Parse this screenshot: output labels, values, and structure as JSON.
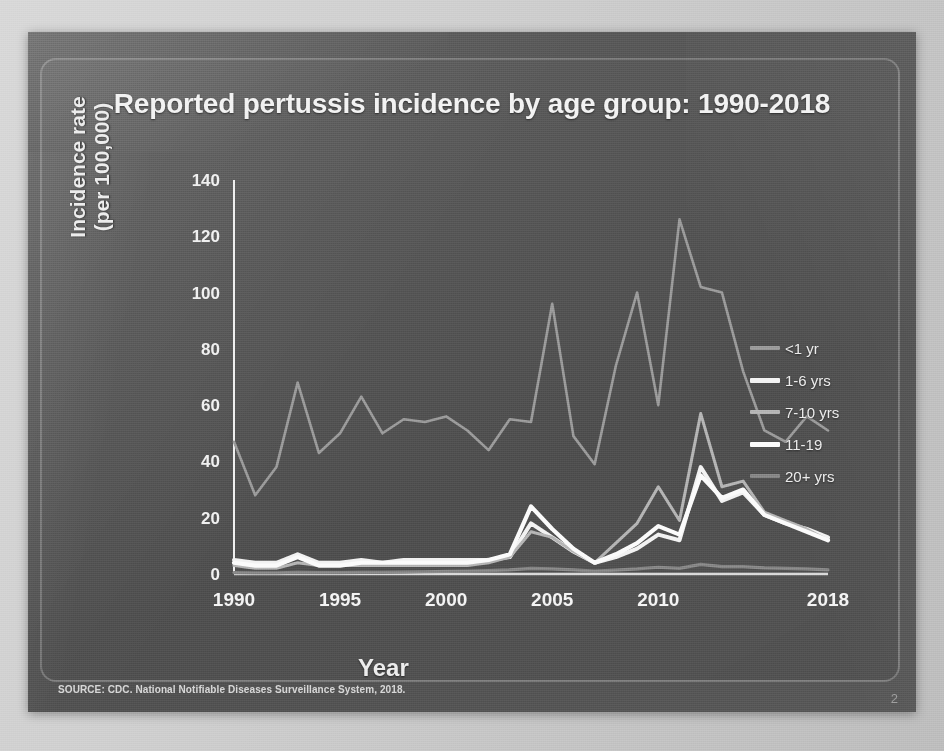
{
  "slide": {
    "title": "Reported pertussis incidence by age group: 1990-2018",
    "source_note": "SOURCE: CDC. National Notifiable Diseases Surveillance System, 2018.",
    "slide_number": "2"
  },
  "legend": {
    "items": [
      {
        "label": "<1 yr",
        "color": "#9a9a9a"
      },
      {
        "label": "1-6 yrs",
        "color": "#f2f2f2"
      },
      {
        "label": "7-10 yrs",
        "color": "#b4b4b4"
      },
      {
        "label": "11-19",
        "color": "#fbfbfb"
      },
      {
        "label": "20+ yrs",
        "color": "#868686"
      }
    ]
  },
  "chart_data": {
    "type": "line",
    "title": "Reported pertussis incidence by age group: 1990-2018",
    "xlabel": "Year",
    "ylabel": "Incidence rate (per 100,000)",
    "xlim": [
      1990,
      2018
    ],
    "ylim": [
      0,
      140
    ],
    "grid": false,
    "legend_position": "right",
    "ytick_labels": [
      "0",
      "20",
      "40",
      "60",
      "80",
      "100",
      "120",
      "140"
    ],
    "yticks": [
      0,
      20,
      40,
      60,
      80,
      100,
      120,
      140
    ],
    "xtick_labels": [
      "1990",
      "1995",
      "2000",
      "2005",
      "2010",
      "2018"
    ],
    "xticks": [
      1990,
      1995,
      2000,
      2005,
      2010,
      2018
    ],
    "x": [
      1990,
      1991,
      1992,
      1993,
      1994,
      1995,
      1996,
      1997,
      1998,
      1999,
      2000,
      2001,
      2002,
      2003,
      2004,
      2005,
      2006,
      2007,
      2008,
      2009,
      2010,
      2011,
      2012,
      2013,
      2014,
      2015,
      2016,
      2017,
      2018
    ],
    "series": [
      {
        "name": "<1 yr",
        "color": "#9a9a9a",
        "values": [
          47,
          28,
          38,
          68,
          43,
          50,
          63,
          50,
          55,
          54,
          56,
          51,
          44,
          55,
          54,
          96,
          49,
          39,
          74,
          100,
          60,
          126,
          102,
          100,
          72,
          51,
          47,
          56,
          51
        ]
      },
      {
        "name": "1-6 yrs",
        "color": "#f2f2f2",
        "values": [
          5,
          4,
          4,
          7,
          4,
          4,
          5,
          4,
          5,
          5,
          5,
          5,
          5,
          6,
          18,
          13,
          8,
          4,
          6,
          9,
          14,
          12,
          38,
          26,
          29,
          21,
          18,
          16,
          13
        ]
      },
      {
        "name": "7-10 yrs",
        "color": "#b4b4b4",
        "values": [
          3,
          2,
          2,
          4,
          3,
          3,
          3,
          3,
          3,
          3,
          3,
          3,
          4,
          6,
          15,
          13,
          8,
          4,
          11,
          18,
          31,
          19,
          57,
          31,
          33,
          22,
          19,
          16,
          12
        ]
      },
      {
        "name": "11-19",
        "color": "#fbfbfb",
        "values": [
          4,
          3,
          3,
          6,
          3,
          3,
          4,
          4,
          4,
          4,
          4,
          4,
          5,
          7,
          24,
          16,
          9,
          4,
          7,
          11,
          17,
          14,
          35,
          27,
          30,
          21,
          18,
          15,
          12
        ]
      },
      {
        "name": "20+ yrs",
        "color": "#868686",
        "values": [
          0.5,
          0.4,
          0.4,
          0.6,
          0.5,
          0.5,
          0.6,
          0.6,
          0.7,
          0.8,
          0.9,
          1.0,
          1.2,
          1.5,
          2.0,
          1.8,
          1.5,
          1.0,
          1.4,
          1.8,
          2.4,
          2.0,
          3.4,
          2.6,
          2.6,
          2.2,
          2.0,
          1.8,
          1.5
        ]
      }
    ]
  }
}
